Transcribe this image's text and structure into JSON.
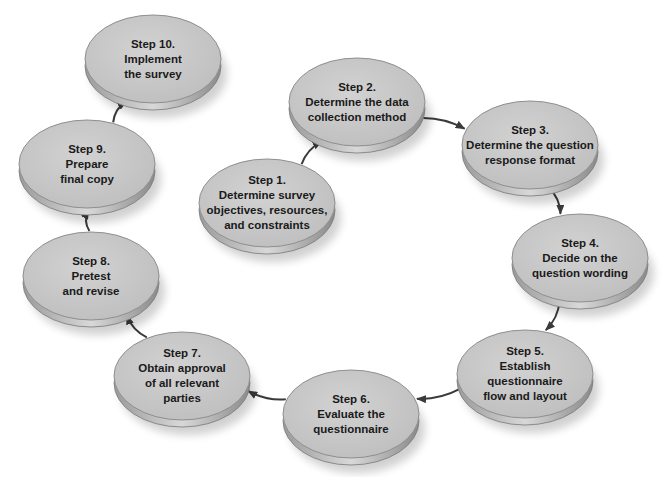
{
  "diagram": {
    "type": "cycle-flow",
    "colors": {
      "node_fill": "#c9c9c9",
      "node_rim": "#8a8a8a",
      "arrow": "#3a3a3a",
      "text": "#1a1a1a",
      "background": "#ffffff"
    },
    "nodes": [
      {
        "id": "step1",
        "title": "Step 1.",
        "lines": [
          "Determine survey",
          "objectives, resources,",
          "and constraints"
        ],
        "cx": 267,
        "cy": 203
      },
      {
        "id": "step2",
        "title": "Step 2.",
        "lines": [
          "Determine the data",
          "collection method"
        ],
        "cx": 357,
        "cy": 102
      },
      {
        "id": "step3",
        "title": "Step 3.",
        "lines": [
          "Determine the question",
          "response format"
        ],
        "cx": 530,
        "cy": 145
      },
      {
        "id": "step4",
        "title": "Step 4.",
        "lines": [
          "Decide on the",
          "question wording"
        ],
        "cx": 580,
        "cy": 258
      },
      {
        "id": "step5",
        "title": "Step 5.",
        "lines": [
          "Establish",
          "questionnaire",
          "flow and layout"
        ],
        "cx": 525,
        "cy": 374
      },
      {
        "id": "step6",
        "title": "Step 6.",
        "lines": [
          "Evaluate the",
          "questionnaire"
        ],
        "cx": 351,
        "cy": 414
      },
      {
        "id": "step7",
        "title": "Step 7.",
        "lines": [
          "Obtain approval",
          "of all relevant",
          "parties"
        ],
        "cx": 182,
        "cy": 376
      },
      {
        "id": "step8",
        "title": "Step 8.",
        "lines": [
          "Pretest",
          "and revise"
        ],
        "cx": 91,
        "cy": 276
      },
      {
        "id": "step9",
        "title": "Step 9.",
        "lines": [
          "Prepare",
          "final copy"
        ],
        "cx": 87,
        "cy": 164
      },
      {
        "id": "step10",
        "title": "Step 10.",
        "lines": [
          "Implement",
          "the survey"
        ],
        "cx": 153,
        "cy": 59
      }
    ],
    "edges": [
      {
        "from": "step1",
        "to": "step2"
      },
      {
        "from": "step2",
        "to": "step3"
      },
      {
        "from": "step3",
        "to": "step4"
      },
      {
        "from": "step4",
        "to": "step5"
      },
      {
        "from": "step5",
        "to": "step6"
      },
      {
        "from": "step6",
        "to": "step7"
      },
      {
        "from": "step7",
        "to": "step8"
      },
      {
        "from": "step8",
        "to": "step9"
      },
      {
        "from": "step9",
        "to": "step10"
      }
    ]
  }
}
